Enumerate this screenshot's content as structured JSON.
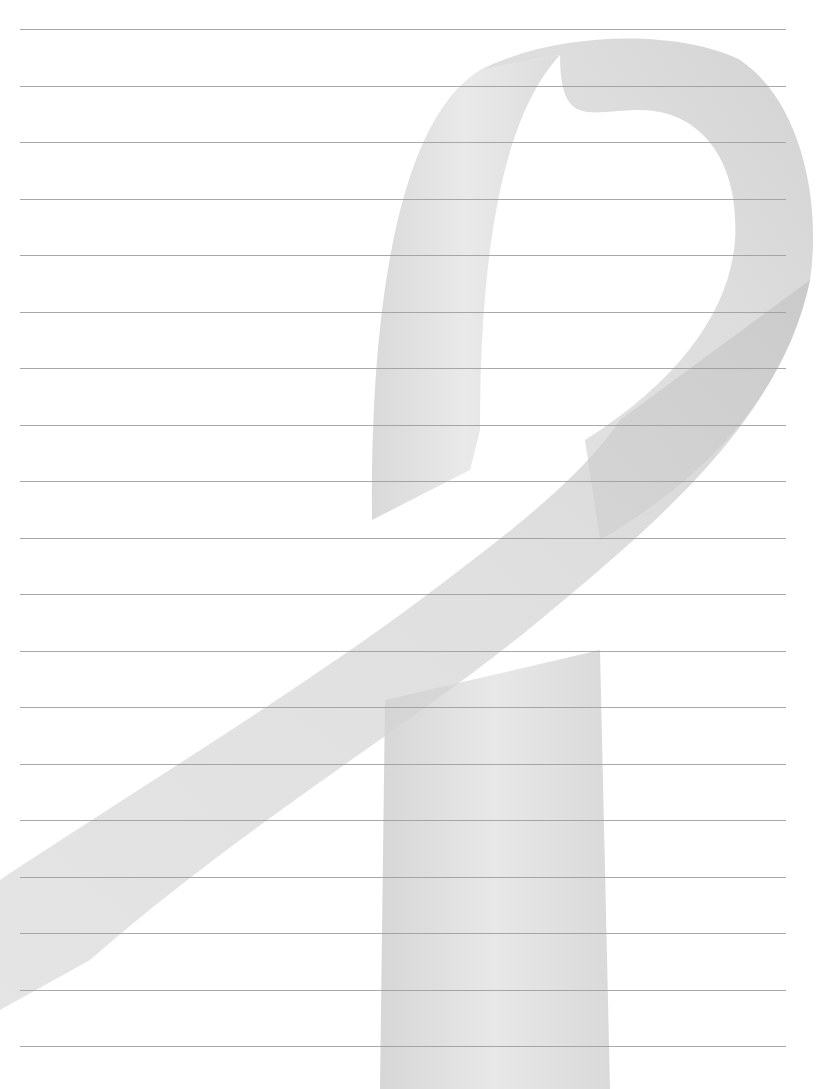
{
  "page": {
    "type": "lined-stationery",
    "background_color": "#ffffff",
    "rule_color": "#9a9a9a",
    "ribbon_color": "#d4d4d4",
    "ribbon_shade_color": "#c2c2c2",
    "rule_count": 19,
    "first_rule_y": 29,
    "rule_spacing": 56.5
  },
  "watermark": {
    "icon": "awareness-ribbon-icon"
  }
}
